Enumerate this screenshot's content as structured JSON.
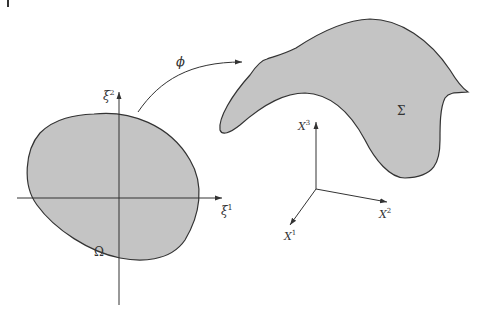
{
  "diagram": {
    "colors": {
      "fill": "#c4c4c4",
      "stroke": "#333333",
      "axis": "#333333",
      "background": "#ffffff"
    },
    "parameter_domain": {
      "label": "Ω",
      "axes": {
        "horizontal": {
          "base": "ξ",
          "sup": "1"
        },
        "vertical": {
          "base": "ξ",
          "sup": "2"
        }
      }
    },
    "mapping": {
      "label": "ϕ"
    },
    "surface": {
      "label": "Σ",
      "axes": {
        "x1": {
          "base": "X",
          "sup": "1"
        },
        "x2": {
          "base": "X",
          "sup": "2"
        },
        "x3": {
          "base": "X",
          "sup": "3"
        }
      }
    }
  }
}
